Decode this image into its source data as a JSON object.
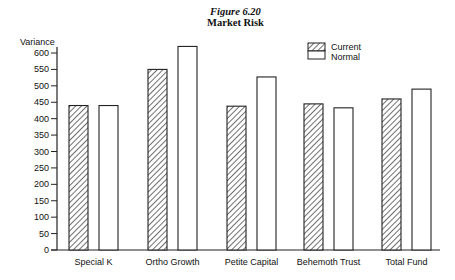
{
  "chart_data": {
    "type": "bar",
    "title": "Figure 6.20",
    "subtitle": "Market Risk",
    "xlabel": "",
    "ylabel": "Variance",
    "ylim": [
      0,
      600
    ],
    "yticks": [
      0,
      50,
      100,
      150,
      200,
      250,
      300,
      350,
      400,
      450,
      500,
      550,
      600
    ],
    "grid": false,
    "legend_position": "top-right",
    "categories": [
      "Special K",
      "Ortho Growth",
      "Petite Capital",
      "Behemoth Trust",
      "Total Fund"
    ],
    "series": [
      {
        "name": "Current",
        "pattern": "hatched",
        "values": [
          440,
          550,
          438,
          445,
          460
        ]
      },
      {
        "name": "Normal",
        "pattern": "white",
        "values": [
          440,
          620,
          527,
          433,
          490
        ]
      }
    ]
  }
}
